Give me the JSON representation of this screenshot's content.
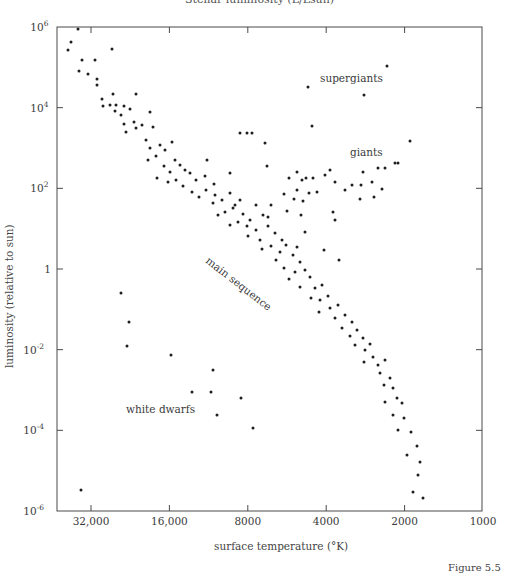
{
  "header_cut_text": "Stellar luminosity (L/Lsun)",
  "figure_caption_cut": "Figure 5.5",
  "chart_data": {
    "type": "scatter",
    "xlabel": "surface temperature (°K)",
    "ylabel": "luminosity (relative to sun)",
    "x_scale": "log",
    "x_reversed": true,
    "y_scale": "log",
    "xlim": [
      45000,
      1000
    ],
    "ylim": [
      1e-06,
      1000000.0
    ],
    "x_ticks": [
      {
        "value": 32000,
        "label": "32,000"
      },
      {
        "value": 16000,
        "label": "16,000"
      },
      {
        "value": 8000,
        "label": "8000"
      },
      {
        "value": 4000,
        "label": "4000"
      },
      {
        "value": 2000,
        "label": "2000"
      },
      {
        "value": 1000,
        "label": "1000"
      }
    ],
    "y_ticks": [
      {
        "exp": 6,
        "label": "10",
        "sup": "6"
      },
      {
        "exp": 4,
        "label": "10",
        "sup": "4"
      },
      {
        "exp": 2,
        "label": "10",
        "sup": "2"
      },
      {
        "exp": 0,
        "label": "1",
        "sup": ""
      },
      {
        "exp": -2,
        "label": "10",
        "sup": "-2"
      },
      {
        "exp": -4,
        "label": "10",
        "sup": "-4"
      },
      {
        "exp": -6,
        "label": "10",
        "sup": "-6"
      }
    ],
    "grid": false,
    "legend": null,
    "annotations": [
      {
        "text": "supergiants",
        "x_px": 320,
        "y_px": 82,
        "rotate": 0
      },
      {
        "text": "giants",
        "x_px": 350,
        "y_px": 156,
        "rotate": 0
      },
      {
        "text": "main sequence",
        "x_px": 205,
        "y_px": 262,
        "rotate": 38
      },
      {
        "text": "white dwarfs",
        "x_px": 126,
        "y_px": 413,
        "rotate": 0
      }
    ],
    "series": [
      {
        "name": "stars",
        "note": "points given as [x_px, y_px] in plot pixel coordinates (read off the figure); x_px=91→32,000 K, 78.4 px/octave; y_px=27→10^6, 40.33 px/decade",
        "points_px": [
          [
            78,
            29
          ],
          [
            71,
            42
          ],
          [
            68,
            50
          ],
          [
            82,
            60
          ],
          [
            95,
            60
          ],
          [
            112,
            49
          ],
          [
            79,
            71
          ],
          [
            88,
            74
          ],
          [
            97,
            79
          ],
          [
            97,
            85
          ],
          [
            113,
            94
          ],
          [
            136,
            94
          ],
          [
            102,
            99
          ],
          [
            110,
            105
          ],
          [
            116,
            105
          ],
          [
            115,
            111
          ],
          [
            124,
            106
          ],
          [
            130,
            109
          ],
          [
            103,
            106
          ],
          [
            121,
            115
          ],
          [
            124,
            124
          ],
          [
            134,
            122
          ],
          [
            142,
            125
          ],
          [
            136,
            128
          ],
          [
            126,
            132
          ],
          [
            150,
            112
          ],
          [
            153,
            127
          ],
          [
            146,
            140
          ],
          [
            150,
            148
          ],
          [
            160,
            145
          ],
          [
            165,
            150
          ],
          [
            172,
            142
          ],
          [
            156,
            156
          ],
          [
            148,
            160
          ],
          [
            175,
            160
          ],
          [
            164,
            166
          ],
          [
            180,
            165
          ],
          [
            170,
            172
          ],
          [
            185,
            170
          ],
          [
            176,
            180
          ],
          [
            190,
            173
          ],
          [
            157,
            178
          ],
          [
            168,
            182
          ],
          [
            196,
            180
          ],
          [
            183,
            186
          ],
          [
            192,
            192
          ],
          [
            205,
            176
          ],
          [
            214,
            184
          ],
          [
            206,
            190
          ],
          [
            199,
            197
          ],
          [
            215,
            195
          ],
          [
            207,
            160
          ],
          [
            230,
            173
          ],
          [
            213,
            203
          ],
          [
            222,
            200
          ],
          [
            230,
            193
          ],
          [
            233,
            208
          ],
          [
            225,
            212
          ],
          [
            240,
            200
          ],
          [
            243,
            214
          ],
          [
            250,
            220
          ],
          [
            238,
            222
          ],
          [
            247,
            226
          ],
          [
            256,
            230
          ],
          [
            230,
            225
          ],
          [
            260,
            240
          ],
          [
            248,
            236
          ],
          [
            235,
            205
          ],
          [
            218,
            215
          ],
          [
            256,
            205
          ],
          [
            263,
            215
          ],
          [
            268,
            226
          ],
          [
            275,
            233
          ],
          [
            262,
            249
          ],
          [
            271,
            246
          ],
          [
            280,
            252
          ],
          [
            286,
            245
          ],
          [
            276,
            260
          ],
          [
            293,
            255
          ],
          [
            300,
            262
          ],
          [
            284,
            268
          ],
          [
            295,
            272
          ],
          [
            289,
            279
          ],
          [
            305,
            270
          ],
          [
            310,
            277
          ],
          [
            300,
            287
          ],
          [
            315,
            288
          ],
          [
            322,
            285
          ],
          [
            311,
            298
          ],
          [
            320,
            300
          ],
          [
            328,
            296
          ],
          [
            330,
            308
          ],
          [
            319,
            312
          ],
          [
            338,
            305
          ],
          [
            335,
            318
          ],
          [
            345,
            315
          ],
          [
            342,
            328
          ],
          [
            352,
            322
          ],
          [
            350,
            336
          ],
          [
            357,
            330
          ],
          [
            363,
            338
          ],
          [
            355,
            345
          ],
          [
            365,
            350
          ],
          [
            370,
            344
          ],
          [
            373,
            357
          ],
          [
            364,
            362
          ],
          [
            378,
            365
          ],
          [
            385,
            360
          ],
          [
            380,
            373
          ],
          [
            390,
            378
          ],
          [
            384,
            385
          ],
          [
            393,
            388
          ],
          [
            397,
            398
          ],
          [
            385,
            402
          ],
          [
            402,
            403
          ],
          [
            393,
            415
          ],
          [
            404,
            418
          ],
          [
            398,
            430
          ],
          [
            411,
            432
          ],
          [
            417,
            446
          ],
          [
            407,
            455
          ],
          [
            420,
            462
          ],
          [
            418,
            475
          ],
          [
            413,
            492
          ],
          [
            423,
            498
          ],
          [
            240,
            133
          ],
          [
            247,
            133
          ],
          [
            252,
            133
          ],
          [
            265,
            143
          ],
          [
            267,
            166
          ],
          [
            297,
            172
          ],
          [
            289,
            178
          ],
          [
            302,
            180
          ],
          [
            306,
            178
          ],
          [
            313,
            178
          ],
          [
            297,
            190
          ],
          [
            284,
            194
          ],
          [
            294,
            199
          ],
          [
            309,
            193
          ],
          [
            317,
            192
          ],
          [
            303,
            201
          ],
          [
            271,
            205
          ],
          [
            287,
            211
          ],
          [
            301,
            215
          ],
          [
            335,
            182
          ],
          [
            330,
            170
          ],
          [
            325,
            175
          ],
          [
            345,
            190
          ],
          [
            352,
            185
          ],
          [
            361,
            185
          ],
          [
            363,
            172
          ],
          [
            372,
            182
          ],
          [
            378,
            168
          ],
          [
            395,
            163
          ],
          [
            385,
            168
          ],
          [
            398,
            163
          ],
          [
            382,
            189
          ],
          [
            374,
            197
          ],
          [
            360,
            199
          ],
          [
            333,
            212
          ],
          [
            268,
            217
          ],
          [
            282,
            240
          ],
          [
            297,
            247
          ],
          [
            305,
            232
          ],
          [
            335,
            220
          ],
          [
            324,
            250
          ],
          [
            339,
            260
          ],
          [
            387,
            66
          ],
          [
            308,
            87
          ],
          [
            364,
            95
          ],
          [
            312,
            126
          ],
          [
            410,
            141
          ],
          [
            121,
            293
          ],
          [
            129,
            322
          ],
          [
            127,
            346
          ],
          [
            171,
            355
          ],
          [
            213,
            370
          ],
          [
            192,
            392
          ],
          [
            211,
            392
          ],
          [
            241,
            398
          ],
          [
            217,
            415
          ],
          [
            253,
            428
          ],
          [
            81,
            490
          ]
        ]
      }
    ]
  }
}
